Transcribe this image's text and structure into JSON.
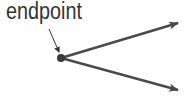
{
  "diagram": {
    "label": "endpoint",
    "colors": {
      "line": "#4a4a4a",
      "text": "#333333",
      "background": "#ffffff"
    },
    "endpoint": {
      "x": 61,
      "y": 58
    },
    "pointer_arrow": {
      "from": [
        49,
        29
      ],
      "to": [
        59,
        52
      ]
    },
    "rays": [
      {
        "name": "upper-ray",
        "to": [
          178,
          23
        ]
      },
      {
        "name": "lower-ray",
        "to": [
          178,
          90
        ]
      }
    ]
  }
}
